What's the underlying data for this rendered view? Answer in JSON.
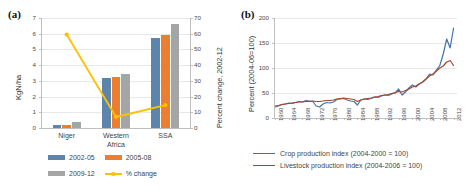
{
  "figure": {
    "panel_a_tag": "(a)",
    "panel_b_tag": "(b)"
  },
  "chart_data": [
    {
      "id": "panel_a",
      "type": "bar",
      "title": "",
      "panel_label": "(a)",
      "categories": [
        "Niger",
        "Western Africa",
        "SSA"
      ],
      "category_lines": [
        [
          "Niger"
        ],
        [
          "Western",
          "Africa"
        ],
        [
          "SSA"
        ]
      ],
      "ylabel": "KgN/ha",
      "ylim": [
        0,
        7
      ],
      "yticks": [
        0,
        1,
        2,
        3,
        4,
        5,
        6,
        7
      ],
      "y2label": "Percent change, 2002-12",
      "y2lim": [
        0,
        70
      ],
      "y2ticks": [
        0,
        10,
        20,
        30,
        40,
        50,
        60,
        70
      ],
      "xlabel": "",
      "grid": true,
      "legend_position": "bottom",
      "series": [
        {
          "name": "2002-05",
          "color": "#5b85ad",
          "type": "bar",
          "axis": "left",
          "values": [
            0.22,
            3.18,
            5.75
          ]
        },
        {
          "name": "2005-08",
          "color": "#ed7d31",
          "type": "bar",
          "axis": "left",
          "values": [
            0.17,
            3.25,
            5.9
          ]
        },
        {
          "name": "2009-12",
          "color": "#a5a5a5",
          "type": "bar",
          "axis": "left",
          "values": [
            0.38,
            3.45,
            6.6
          ]
        },
        {
          "name": "% change",
          "color": "#ffc000",
          "type": "line",
          "axis": "right",
          "values": [
            59.5,
            7.0,
            14.5
          ]
        }
      ]
    },
    {
      "id": "panel_b",
      "type": "line",
      "title": "",
      "panel_label": "(b)",
      "ylabel": "Percent (2004-06=100)",
      "ylim": [
        0,
        200
      ],
      "yticks": [
        0,
        50,
        100,
        150,
        200
      ],
      "xlabel": "",
      "xlim": [
        1960,
        2013
      ],
      "xticks": [
        1960,
        1964,
        1968,
        1972,
        1976,
        1980,
        1984,
        1988,
        1992,
        1996,
        2000,
        2004,
        2008,
        2012
      ],
      "grid": true,
      "legend_position": "bottom",
      "x": [
        1960,
        1961,
        1962,
        1963,
        1964,
        1965,
        1966,
        1967,
        1968,
        1969,
        1970,
        1971,
        1972,
        1973,
        1974,
        1975,
        1976,
        1977,
        1978,
        1979,
        1980,
        1981,
        1982,
        1983,
        1984,
        1985,
        1986,
        1987,
        1988,
        1989,
        1990,
        1991,
        1992,
        1993,
        1994,
        1995,
        1996,
        1997,
        1998,
        1999,
        2000,
        2001,
        2002,
        2003,
        2004,
        2005,
        2006,
        2007,
        2008,
        2009,
        2010,
        2011,
        2012
      ],
      "series": [
        {
          "name": "Crop production index (2004-2000 = 100)",
          "color": "#4472a8",
          "values": [
            22,
            24,
            27,
            28,
            30,
            29,
            31,
            33,
            32,
            35,
            34,
            33,
            24,
            22,
            28,
            31,
            30,
            32,
            37,
            38,
            39,
            36,
            34,
            33,
            26,
            36,
            38,
            37,
            39,
            42,
            41,
            44,
            46,
            45,
            48,
            50,
            58,
            46,
            52,
            60,
            66,
            62,
            68,
            72,
            78,
            88,
            86,
            96,
            105,
            128,
            158,
            140,
            180,
            168
          ]
        },
        {
          "name": "Livestock production index (2004-2006 = 100)",
          "color": "#a8432a",
          "values": [
            24,
            25,
            27,
            28,
            29,
            30,
            31,
            32,
            32,
            33,
            33,
            34,
            33,
            33,
            34,
            35,
            35,
            36,
            38,
            39,
            40,
            39,
            38,
            37,
            33,
            36,
            38,
            39,
            40,
            42,
            43,
            45,
            46,
            47,
            49,
            51,
            53,
            52,
            55,
            58,
            62,
            64,
            68,
            72,
            78,
            84,
            88,
            94,
            100,
            104,
            112,
            115,
            105,
            100
          ]
        }
      ]
    }
  ],
  "panel_a": {
    "ylabel": "KgN/ha",
    "y2label": "Percent change, 2002-12",
    "yticks": [
      "0",
      "1",
      "2",
      "3",
      "4",
      "5",
      "6",
      "7"
    ],
    "y2ticks": [
      "0",
      "10",
      "20",
      "30",
      "40",
      "50",
      "60",
      "70"
    ],
    "categories": [
      {
        "line1": "Niger",
        "line2": ""
      },
      {
        "line1": "Western",
        "line2": "Africa"
      },
      {
        "line1": "SSA",
        "line2": ""
      }
    ],
    "legend": [
      {
        "label": "2002-05",
        "color": "#5b85ad",
        "kind": "box"
      },
      {
        "label": "2005-08",
        "color": "#ed7d31",
        "kind": "box"
      },
      {
        "label": "2009-12",
        "color": "#a5a5a5",
        "kind": "box"
      },
      {
        "label": "% change",
        "color": "#ffc000",
        "kind": "line"
      }
    ]
  },
  "panel_b": {
    "ylabel": "Percent (2004-06=100)",
    "yticks": [
      "0",
      "50",
      "100",
      "150",
      "200"
    ],
    "xticks": [
      "1960",
      "1964",
      "1968",
      "1972",
      "1976",
      "1980",
      "1984",
      "1988",
      "1992",
      "1996",
      "2000",
      "2004",
      "2008",
      "2012"
    ],
    "legend": [
      {
        "label": "Crop production index (2004-2000 = 100)",
        "color": "#4472a8"
      },
      {
        "label": "Livestock production index (2004-2006 = 100)",
        "color": "#a8432a"
      }
    ]
  }
}
